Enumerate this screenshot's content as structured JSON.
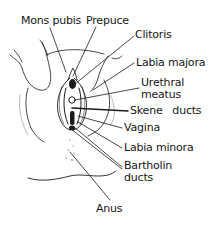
{
  "diagram": {
    "type": "anatomical-line-drawing",
    "labels": [
      {
        "id": "mons-pubis",
        "text": "Mons pubis",
        "x": 21,
        "y": 15
      },
      {
        "id": "prepuce",
        "text": "Prepuce",
        "x": 86,
        "y": 15
      },
      {
        "id": "clitoris",
        "text": "Clitoris",
        "x": 135,
        "y": 29
      },
      {
        "id": "labia-majora",
        "text": "Labia majora",
        "x": 136,
        "y": 57
      },
      {
        "id": "urethral-meatus-1",
        "text": "Urethral",
        "x": 141,
        "y": 77
      },
      {
        "id": "urethral-meatus-2",
        "text": "meatus",
        "x": 141,
        "y": 89
      },
      {
        "id": "skene-ducts",
        "text": "Skene   ducts",
        "x": 130,
        "y": 105
      },
      {
        "id": "vagina",
        "text": "Vagina",
        "x": 124,
        "y": 122
      },
      {
        "id": "labia-minora",
        "text": "Labia minora",
        "x": 124,
        "y": 142
      },
      {
        "id": "bartholin-ducts-1",
        "text": "Bartholin",
        "x": 124,
        "y": 160
      },
      {
        "id": "bartholin-ducts-2",
        "text": "ducts",
        "x": 124,
        "y": 172
      },
      {
        "id": "anus",
        "text": "Anus",
        "x": 96,
        "y": 203
      }
    ],
    "line_color": "#1a1a1a",
    "background": "#ffffff"
  }
}
